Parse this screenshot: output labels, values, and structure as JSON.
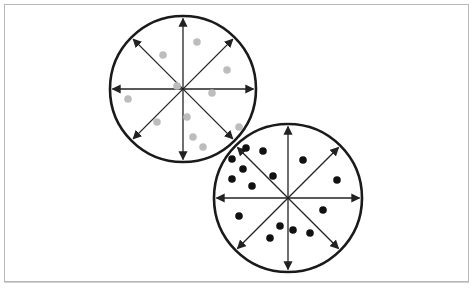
{
  "figure": {
    "colors": {
      "background": "#ffffff",
      "frame": "#b8b8b8",
      "circle_stroke": "#1a1a1a",
      "arrow_stroke": "#222222",
      "gray_particles": "#bdbdbd",
      "black_particles": "#111111"
    }
  },
  "circles": [
    {
      "name": "upper-left-circle",
      "cx": 183,
      "cy": 89,
      "r": 73,
      "particle_color": "#bdbdbd",
      "particles": [
        [
          197,
          42
        ],
        [
          163,
          55
        ],
        [
          227,
          70
        ],
        [
          177,
          86
        ],
        [
          212,
          93
        ],
        [
          128,
          99
        ],
        [
          157,
          122
        ],
        [
          187,
          117
        ],
        [
          239,
          127
        ],
        [
          193,
          137
        ],
        [
          203,
          147
        ]
      ]
    },
    {
      "name": "lower-right-circle",
      "cx": 288,
      "cy": 198,
      "r": 74,
      "particle_color": "#111111",
      "particles": [
        [
          246,
          148
        ],
        [
          263,
          151
        ],
        [
          232,
          159
        ],
        [
          243,
          169
        ],
        [
          303,
          160
        ],
        [
          232,
          179
        ],
        [
          273,
          176
        ],
        [
          252,
          186
        ],
        [
          337,
          180
        ],
        [
          323,
          210
        ],
        [
          239,
          216
        ],
        [
          280,
          226
        ],
        [
          293,
          230
        ],
        [
          310,
          233
        ],
        [
          270,
          238
        ]
      ]
    }
  ]
}
